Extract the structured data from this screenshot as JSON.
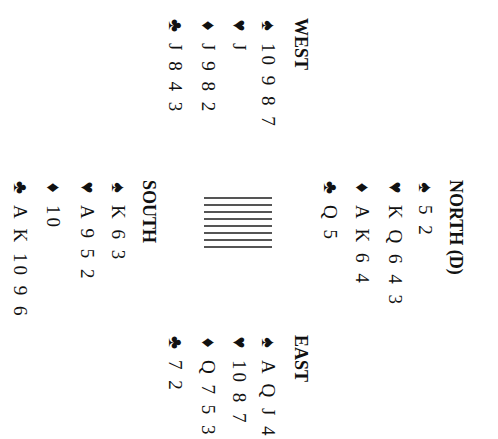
{
  "diagram": {
    "orientation": "rotated 90 degrees clockwise",
    "north": {
      "title": "NORTH (D)",
      "spades": "5 2",
      "hearts": "K Q 6 4 3",
      "diamonds": "A K 6 4",
      "clubs": "Q 5"
    },
    "west": {
      "title": "WEST",
      "spades": "10 9 8 7",
      "hearts": "J",
      "diamonds": "J 9 8 2",
      "clubs": "J 8 4 3"
    },
    "east": {
      "title": "EAST",
      "spades": "A Q J 4",
      "hearts": "10 8 7",
      "diamonds": "Q 7 5 3",
      "clubs": "7 2"
    },
    "south": {
      "title": "SOUTH",
      "spades": "K 6 3",
      "hearts": "A 9 5 2",
      "diamonds": "10",
      "clubs": "A K 10 9 6"
    },
    "symbols": {
      "spades": "♠",
      "hearts": "♥",
      "diamonds": "♦",
      "clubs": "♣"
    },
    "center_lines": 8
  }
}
